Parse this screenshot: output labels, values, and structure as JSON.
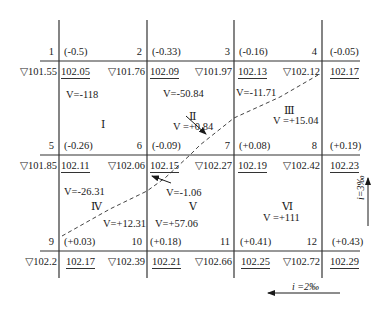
{
  "diagram": {
    "grid": {
      "columns_x": [
        59,
        147,
        234,
        322
      ],
      "rows_y": [
        61,
        155,
        251
      ]
    },
    "nodes": [
      {
        "id": "1",
        "cut_fill": "(-0.5)",
        "natural": "▽101.55",
        "design": "102.05"
      },
      {
        "id": "2",
        "cut_fill": "(-0.33)",
        "natural": "▽101.76",
        "design": "102.09"
      },
      {
        "id": "3",
        "cut_fill": "(-0.16)",
        "natural": "▽101.97",
        "design": "102.13"
      },
      {
        "id": "4",
        "cut_fill": "(-0.05)",
        "natural": "▽102.12",
        "design": "102.17"
      },
      {
        "id": "5",
        "cut_fill": "(-0.26)",
        "natural": "▽101.85",
        "design": "102.11"
      },
      {
        "id": "6",
        "cut_fill": "(-0.09)",
        "natural": "▽102.06",
        "design": "102.15"
      },
      {
        "id": "7",
        "cut_fill": "(+0.08)",
        "natural": "▽102.27",
        "design": "102.19"
      },
      {
        "id": "8",
        "cut_fill": "(+0.19)",
        "natural": "▽102.42",
        "design": "102.23"
      },
      {
        "id": "9",
        "cut_fill": "(+0.03)",
        "natural": "▽102.2",
        "design": "102.17"
      },
      {
        "id": "10",
        "cut_fill": "(+0.18)",
        "natural": "▽102.39",
        "design": "102.21"
      },
      {
        "id": "11",
        "cut_fill": "(+0.41)",
        "natural": "▽102.66",
        "design": "102.25"
      },
      {
        "id": "12",
        "cut_fill": "(+0.43)",
        "natural": "▽102.72",
        "design": "102.29"
      }
    ],
    "squares": [
      {
        "id": "I",
        "volumes": [
          "V=-118"
        ]
      },
      {
        "id": "II",
        "volumes": [
          "V=-50.84",
          "V =+0.84"
        ]
      },
      {
        "id": "III",
        "volumes": [
          "V=-11.71",
          "V =+15.04"
        ]
      },
      {
        "id": "IV",
        "volumes": [
          "V=-26.31",
          "V=+12.31"
        ]
      },
      {
        "id": "V",
        "volumes": [
          "V=-1.06",
          "V=+57.06"
        ]
      },
      {
        "id": "VI",
        "volumes": [
          "V =+111"
        ]
      }
    ],
    "roman": {
      "I": "Ⅰ",
      "II": "Ⅱ",
      "III": "Ⅲ",
      "IV": "Ⅳ",
      "V": "Ⅴ",
      "VI": "Ⅵ"
    },
    "slopes": {
      "horizontal": "i =2‰",
      "vertical": "i=3‰"
    },
    "zero_line": "dashed line from node 9 to near node 4",
    "colors": {
      "line": "#333333",
      "text": "#1a1a1a",
      "background": "#ffffff"
    }
  }
}
